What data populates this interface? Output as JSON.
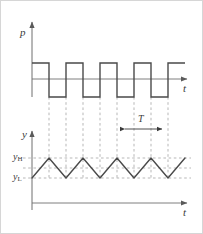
{
  "figure": {
    "title": "",
    "width": 203,
    "height": 234,
    "background": "#ffffff",
    "border_color": "#d6d6d6"
  },
  "colors": {
    "axis": "#6f6f6f",
    "waveform": "#4a4a4a",
    "dashed": "#8f8f8f",
    "label": "#3a3a3a"
  },
  "labels": {
    "p_axis": "p",
    "y_axis": "y",
    "t_axis_top": "t",
    "t_axis_bottom": "t",
    "period": "T",
    "level_high_base": "y",
    "level_high_sub": "H",
    "level_low_base": "y",
    "level_low_sub": "L"
  },
  "chart_data": [
    {
      "type": "line",
      "name": "drive-signal",
      "title": "",
      "xlabel": "t",
      "ylabel": "p",
      "waveform": "square",
      "description": "Periodic rectangular pulse train with 50% duty cycle",
      "levels": {
        "high": 1,
        "low": -1,
        "zero": 0
      },
      "edges_x": [
        31,
        48,
        65,
        82,
        99,
        116,
        133,
        150,
        167
      ],
      "x": [
        31,
        48,
        48,
        65,
        65,
        82,
        82,
        99,
        99,
        116,
        116,
        133,
        133,
        150,
        150,
        167,
        167,
        184
      ],
      "y": [
        1,
        1,
        -1,
        -1,
        1,
        1,
        -1,
        -1,
        1,
        1,
        -1,
        -1,
        1,
        1,
        -1,
        -1,
        1,
        1
      ],
      "ylim": [
        -1.6,
        1.9
      ],
      "grid": false,
      "legend": "none"
    },
    {
      "type": "line",
      "name": "response-signal",
      "title": "",
      "xlabel": "t",
      "ylabel": "y",
      "waveform": "triangular-ripple",
      "description": "Triangular ripple oscillating between y_L and y_H, rising during pulse-high and falling during pulse-low",
      "levels": {
        "y_H": 1,
        "y_mid": 0.5,
        "y_L": 0
      },
      "x": [
        31,
        48,
        65,
        82,
        99,
        116,
        133,
        150,
        167,
        184
      ],
      "y": [
        0,
        1,
        0,
        1,
        0,
        1,
        0,
        1,
        0,
        1
      ],
      "ylim": [
        -0.35,
        1.35
      ],
      "grid": false,
      "legend": "none",
      "annotations": [
        {
          "label": "T",
          "type": "double-arrow",
          "x_from": 122,
          "x_to": 163,
          "meaning": "period of one ripple cycle"
        }
      ],
      "reference_lines": [
        {
          "label": "y_H",
          "style": "dashed"
        },
        {
          "label": "",
          "style": "dashed"
        },
        {
          "label": "y_L",
          "style": "dashed"
        }
      ]
    }
  ]
}
